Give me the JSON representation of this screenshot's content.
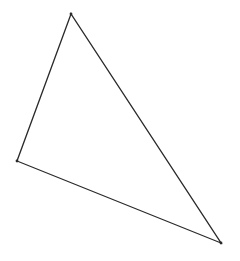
{
  "diagram": {
    "type": "triangle",
    "stroke_color": "#2a2a2a",
    "background": "#ffffff",
    "vertices": [
      {
        "name": "top",
        "x": 71,
        "y": 14
      },
      {
        "name": "left",
        "x": 17,
        "y": 161
      },
      {
        "name": "bottom-right",
        "x": 221,
        "y": 243
      }
    ]
  }
}
